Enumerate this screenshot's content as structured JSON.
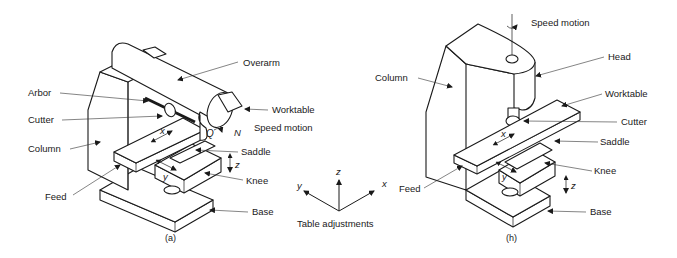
{
  "figure_a": {
    "caption": "(a)",
    "labels": {
      "overarm": "Overarm",
      "arbor": "Arbor",
      "cutter": "Cutter",
      "worktable": "Worktable",
      "speed_motion": "Speed motion",
      "column": "Column",
      "saddle": "Saddle",
      "knee": "Knee",
      "feed": "Feed",
      "base": "Base",
      "n": "N",
      "x": "x",
      "y": "y",
      "z": "z"
    }
  },
  "figure_b": {
    "caption": "(h)",
    "labels": {
      "speed_motion": "Speed motion",
      "head": "Head",
      "column": "Column",
      "worktable": "Worktable",
      "cutter": "Cutter",
      "saddle": "Saddle",
      "knee": "Knee",
      "feed": "Feed",
      "base": "Base",
      "x": "x",
      "y": "y",
      "z": "z"
    }
  },
  "axes_legend": {
    "caption": "Table adjustments",
    "x": "x",
    "y": "y",
    "z": "z"
  }
}
